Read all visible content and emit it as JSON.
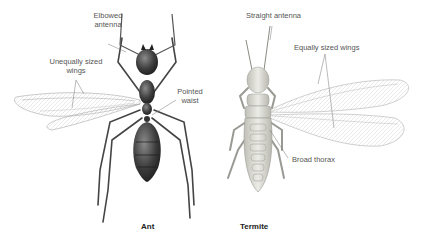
{
  "diagram": {
    "ant": {
      "caption": "Ant",
      "labels": {
        "elbowed_antenna_1": "Elbowed",
        "elbowed_antenna_2": "antenna",
        "wings_1": "Unequally sized",
        "wings_2": "wings",
        "waist_1": "Pointed",
        "waist_2": "waist"
      }
    },
    "termite": {
      "caption": "Termite",
      "labels": {
        "antenna": "Straight antenna",
        "wings": "Equally sized wings",
        "thorax": "Broad thorax"
      }
    },
    "colors": {
      "ant_body": "#3a3a3a",
      "termite_body": "#d8d8d0",
      "wing": "#d9d9d9",
      "label_text": "#555555",
      "leader_line": "#777777"
    }
  }
}
